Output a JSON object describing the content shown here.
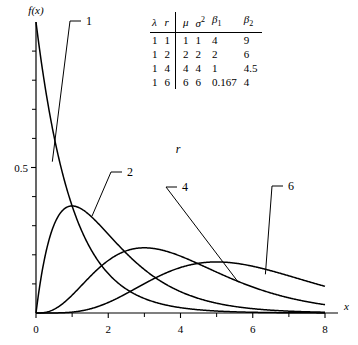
{
  "figure": {
    "axis_x_label": "x",
    "axis_y_label": "f(x)",
    "annotation_r": "r"
  },
  "table": {
    "headers": [
      "λ",
      "r",
      "μ",
      "σ²",
      "β₁",
      "β₂"
    ],
    "header_parts": [
      {
        "base": "λ",
        "sup": "",
        "sub": ""
      },
      {
        "base": "r",
        "sup": "",
        "sub": ""
      },
      {
        "base": "μ",
        "sup": "",
        "sub": ""
      },
      {
        "base": "σ",
        "sup": "2",
        "sub": ""
      },
      {
        "base": "β",
        "sup": "",
        "sub": "1"
      },
      {
        "base": "β",
        "sup": "",
        "sub": "2"
      }
    ],
    "rows": [
      [
        "1",
        "1",
        "1",
        "1",
        "4",
        "9"
      ],
      [
        "1",
        "2",
        "2",
        "2",
        "2",
        "6"
      ],
      [
        "1",
        "4",
        "4",
        "4",
        "1",
        "4.5"
      ],
      [
        "1",
        "6",
        "6",
        "6",
        "0.167",
        "4"
      ]
    ]
  },
  "chart_data": {
    "type": "line",
    "title": "",
    "xlabel": "x",
    "ylabel": "f(x)",
    "xlim": [
      0,
      8
    ],
    "ylim": [
      0,
      1.0
    ],
    "xticks": [
      0,
      2,
      4,
      6,
      8
    ],
    "xtick_labels": [
      "0",
      "2",
      "4",
      "6",
      "8"
    ],
    "xminor_ticks": [
      1,
      3,
      5,
      7
    ],
    "yticks": [
      0.5
    ],
    "ytick_labels": [
      "0.5"
    ],
    "yminor_ticks": [
      0.1,
      0.2,
      0.3,
      0.4,
      0.6,
      0.7,
      0.8,
      0.9
    ],
    "grid": false,
    "legend_position": "inline-labels",
    "distribution": "Erlang (gamma) probability density, lambda = 1",
    "series": [
      {
        "name": "1",
        "label": "1",
        "r": 1,
        "lambda": 1,
        "x": [
          0,
          0.1,
          0.2,
          0.3,
          0.4,
          0.5,
          0.75,
          1,
          1.25,
          1.5,
          1.75,
          2,
          2.5,
          3,
          3.5,
          4,
          4.5,
          5,
          5.5,
          6,
          6.5,
          7,
          7.5,
          8
        ],
        "y": [
          1,
          0.905,
          0.819,
          0.741,
          0.67,
          0.607,
          0.472,
          0.368,
          0.287,
          0.223,
          0.174,
          0.135,
          0.082,
          0.05,
          0.03,
          0.018,
          0.011,
          0.007,
          0.004,
          0.002,
          0.002,
          0.001,
          0.001,
          0.0
        ]
      },
      {
        "name": "2",
        "label": "2",
        "r": 2,
        "lambda": 1,
        "x": [
          0,
          0.25,
          0.5,
          0.75,
          1,
          1.25,
          1.5,
          1.75,
          2,
          2.5,
          3,
          3.5,
          4,
          4.5,
          5,
          5.5,
          6,
          6.5,
          7,
          7.5,
          8
        ],
        "y": [
          0,
          0.195,
          0.303,
          0.354,
          0.368,
          0.358,
          0.335,
          0.304,
          0.271,
          0.205,
          0.149,
          0.106,
          0.073,
          0.05,
          0.034,
          0.022,
          0.015,
          0.01,
          0.006,
          0.004,
          0.003
        ]
      },
      {
        "name": "4",
        "label": "4",
        "r": 4,
        "lambda": 1,
        "x": [
          0,
          0.5,
          1,
          1.5,
          2,
          2.5,
          3,
          3.5,
          4,
          4.5,
          5,
          5.5,
          6,
          6.5,
          7,
          7.5,
          8
        ],
        "y": [
          0,
          0.013,
          0.061,
          0.126,
          0.18,
          0.214,
          0.224,
          0.216,
          0.195,
          0.169,
          0.14,
          0.113,
          0.089,
          0.069,
          0.052,
          0.039,
          0.029
        ]
      },
      {
        "name": "6",
        "label": "6",
        "r": 6,
        "lambda": 1,
        "x": [
          0,
          0.5,
          1,
          1.5,
          2,
          2.5,
          3,
          3.5,
          4,
          4.5,
          5,
          5.5,
          6,
          6.5,
          7,
          7.5,
          8
        ],
        "y": [
          0,
          0.0,
          0.003,
          0.016,
          0.036,
          0.067,
          0.101,
          0.13,
          0.156,
          0.17,
          0.175,
          0.172,
          0.161,
          0.146,
          0.128,
          0.109,
          0.091
        ]
      }
    ],
    "curve_labels": [
      {
        "text": "1",
        "x_px": 86,
        "y_px": 25
      },
      {
        "text": "2",
        "x_px": 127,
        "y_px": 176
      },
      {
        "text": "4",
        "x_px": 182,
        "y_px": 191
      },
      {
        "text": "6",
        "x_px": 288,
        "y_px": 190
      }
    ]
  }
}
